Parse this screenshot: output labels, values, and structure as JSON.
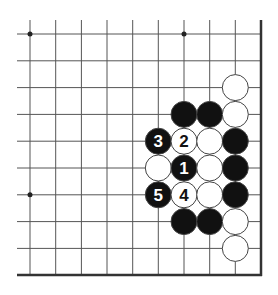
{
  "diagram": {
    "type": "go-board-fragment",
    "colors": {
      "background": "#ffffff",
      "grid_line": "#555555",
      "edge_line": "#333333",
      "black_stone": "#111111",
      "white_stone": "#ffffff",
      "stone_outline": "#444444",
      "black_label": "#ffffff",
      "white_label": "#111111"
    },
    "grid": {
      "columns_x": [
        30,
        55.7,
        81.4,
        107,
        132.7,
        158.3,
        184,
        209.7,
        235.3
      ],
      "rows_y": [
        34,
        60.8,
        87.6,
        114.4,
        141.2,
        168,
        194.8,
        221.6,
        248.4
      ],
      "open_left_x": 17,
      "open_top_y": 20,
      "right_edge_x": 261,
      "bottom_edge_y": 275,
      "stone_radius": 13
    },
    "star_points": [
      {
        "col": 0,
        "row": 0
      },
      {
        "col": 6,
        "row": 0
      },
      {
        "col": 0,
        "row": 6
      }
    ],
    "stones": [
      {
        "color": "white",
        "col": 8,
        "row": 2,
        "label": ""
      },
      {
        "color": "black",
        "col": 6,
        "row": 3,
        "label": ""
      },
      {
        "color": "black",
        "col": 7,
        "row": 3,
        "label": ""
      },
      {
        "color": "white",
        "col": 8,
        "row": 3,
        "label": ""
      },
      {
        "color": "black",
        "col": 5,
        "row": 4,
        "label": "3"
      },
      {
        "color": "white",
        "col": 6,
        "row": 4,
        "label": "2"
      },
      {
        "color": "white",
        "col": 7,
        "row": 4,
        "label": ""
      },
      {
        "color": "black",
        "col": 8,
        "row": 4,
        "label": ""
      },
      {
        "color": "white",
        "col": 5,
        "row": 5,
        "label": ""
      },
      {
        "color": "black",
        "col": 6,
        "row": 5,
        "label": "1"
      },
      {
        "color": "white",
        "col": 7,
        "row": 5,
        "label": ""
      },
      {
        "color": "black",
        "col": 8,
        "row": 5,
        "label": ""
      },
      {
        "color": "black",
        "col": 5,
        "row": 6,
        "label": "5"
      },
      {
        "color": "white",
        "col": 6,
        "row": 6,
        "label": "4"
      },
      {
        "color": "white",
        "col": 7,
        "row": 6,
        "label": ""
      },
      {
        "color": "black",
        "col": 8,
        "row": 6,
        "label": ""
      },
      {
        "color": "black",
        "col": 6,
        "row": 7,
        "label": ""
      },
      {
        "color": "black",
        "col": 7,
        "row": 7,
        "label": ""
      },
      {
        "color": "white",
        "col": 8,
        "row": 7,
        "label": ""
      },
      {
        "color": "white",
        "col": 8,
        "row": 8,
        "label": ""
      }
    ]
  }
}
